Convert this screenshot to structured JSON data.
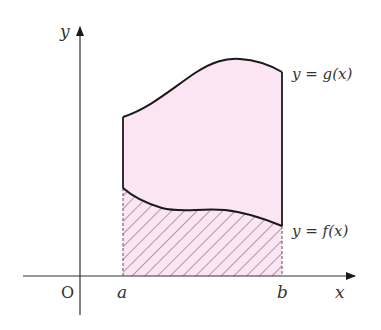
{
  "diagram": {
    "colors": {
      "background": "#ffffff",
      "region_fill": "#fbe4f3",
      "hatch": "#8a6f80",
      "curve": "#1a1a1a",
      "axis": "#333333",
      "text": "#333333"
    },
    "axes": {
      "x_label": "x",
      "y_label": "y",
      "origin_label": "O"
    },
    "bounds": {
      "a_label": "a",
      "b_label": "b"
    },
    "curves": [
      {
        "name": "g",
        "label": "y = g(x)",
        "role": "upper curve"
      },
      {
        "name": "f",
        "label": "y = f(x)",
        "role": "lower curve"
      }
    ],
    "regions": [
      {
        "name": "between-curves",
        "fill": "solid pink",
        "description": "region between f and g"
      },
      {
        "name": "under-f",
        "fill": "hatched pink",
        "description": "region under f above x-axis"
      }
    ]
  }
}
